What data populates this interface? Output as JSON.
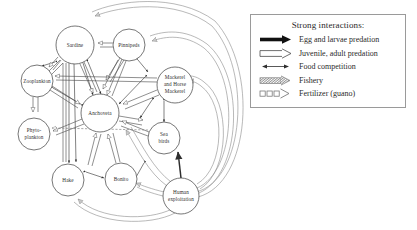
{
  "diagram": {
    "nodes": [
      {
        "id": "sardine",
        "label": "Sardine",
        "lines": [
          "Sardine"
        ],
        "cx": 75,
        "cy": 45,
        "r": 19
      },
      {
        "id": "pinnipeds",
        "label": "Pinnipeds",
        "lines": [
          "Pinnipeds"
        ],
        "cx": 129,
        "cy": 45,
        "r": 16
      },
      {
        "id": "zooplankton",
        "label": "Zooplankton",
        "lines": [
          "Zooplankton"
        ],
        "cx": 37,
        "cy": 81,
        "r": 16
      },
      {
        "id": "mackerel",
        "label": "Mackerel and Horse Mackerel",
        "lines": [
          "Mackerel",
          "and Horse",
          "Mackerel"
        ],
        "cx": 175,
        "cy": 85,
        "r": 18
      },
      {
        "id": "anchoveta",
        "label": "Anchoveta",
        "lines": [
          "Anchoveta"
        ],
        "cx": 100,
        "cy": 113,
        "r": 19
      },
      {
        "id": "phytoplankton",
        "label": "Phytoplankton",
        "lines": [
          "Phyto-",
          "plankton"
        ],
        "cx": 34,
        "cy": 134,
        "r": 16
      },
      {
        "id": "seabirds",
        "label": "Sea birds",
        "lines": [
          "Sea",
          "birds"
        ],
        "cx": 164,
        "cy": 138,
        "r": 16
      },
      {
        "id": "hake",
        "label": "Hake",
        "lines": [
          "Hake"
        ],
        "cx": 68,
        "cy": 180,
        "r": 16
      },
      {
        "id": "bonito",
        "label": "Bonito",
        "lines": [
          "Bonito"
        ],
        "cx": 121,
        "cy": 179,
        "r": 16
      },
      {
        "id": "human",
        "label": "Human exploitation",
        "lines": [
          "Human",
          "exploitation"
        ],
        "cx": 181,
        "cy": 196,
        "r": 18
      }
    ]
  },
  "legend": {
    "title": "Strong interactions:",
    "items": [
      {
        "id": "egg-larvae-predation",
        "label": "Egg and larvae predation",
        "style": "solid-filled-arrow"
      },
      {
        "id": "juvenile-adult-predation",
        "label": "Juvenile, adult predation",
        "style": "hollow-block-arrow"
      },
      {
        "id": "food-competition",
        "label": "Food competition",
        "style": "thin-double-headed-line"
      },
      {
        "id": "fishery",
        "label": "Fishery",
        "style": "hatched-block-arrow"
      },
      {
        "id": "fertilizer-guano",
        "label": "Fertilizer (guano)",
        "style": "dashed-block-arrow"
      }
    ]
  },
  "colors": {
    "ink": "#2e2e2e",
    "stroke": "#4a4a4a",
    "background": "#ffffff",
    "legend_border": "#9a9a9a",
    "hatch": "#8d8d8d"
  }
}
